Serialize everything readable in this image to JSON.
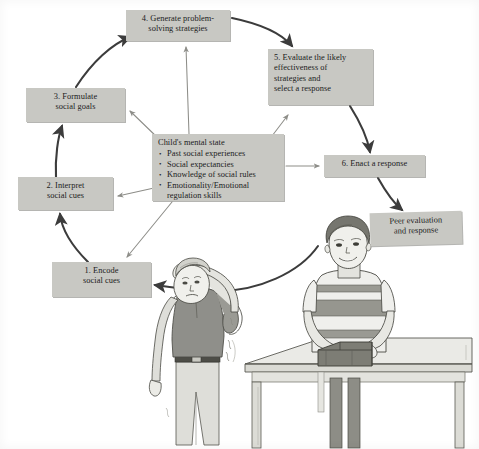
{
  "figure": {
    "background_color": "#ffffff",
    "box_fill_color": "#c8c8c3",
    "text_color": "#1b1b1b",
    "thick_arrow_color": "#3c3c3c",
    "thin_arrow_color": "#8d8d88"
  },
  "nodes": {
    "step1": {
      "line1": "1. Encode",
      "line2": "social cues"
    },
    "step2": {
      "line1": "2. Interpret",
      "line2": "social cues"
    },
    "step3": {
      "line1": "3. Formulate",
      "line2": "social goals"
    },
    "step4": {
      "line1": "4. Generate problem-",
      "line2": "solving strategies"
    },
    "step5": {
      "line1": "5. Evaluate the likely",
      "line2": "effectiveness of",
      "line3": "strategies and",
      "line4": "select a response"
    },
    "step6": {
      "line1": "6. Enact a response"
    },
    "peer": {
      "line1": "Peer evaluation",
      "line2": "and response"
    },
    "center": {
      "heading": "Child's mental state",
      "bullets": [
        "Past social experiences",
        "Social expectancies",
        "Knowledge of social rules",
        "Emotionality/Emotional\nregulation skills"
      ]
    }
  },
  "illustration": {
    "description": "Two boys: one at left with hand raised to his head looking upset, one at right behind a table holding a box",
    "left_boy": {
      "name": "upset-boy",
      "shirt_color": "#8f8f8a",
      "pants_color": "#d7d7d2"
    },
    "right_boy": {
      "name": "peer-boy",
      "shirt_description": "horizontally striped t-shirt",
      "stripe_color": "#96968f",
      "shirt_base_color": "#efefec"
    },
    "table": {
      "name": "table",
      "top_color": "#ebebe7",
      "leg_color": "#dcdcd6"
    },
    "box_object": {
      "name": "box-on-table",
      "color": "#828279"
    }
  }
}
